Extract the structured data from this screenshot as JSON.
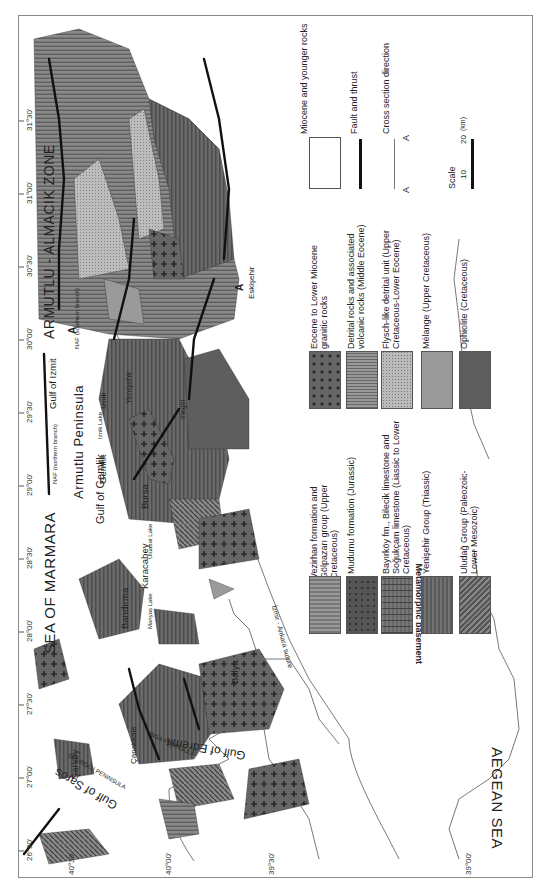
{
  "map": {
    "orientation": "rotated -90 degrees (north at left)",
    "longitude_ticks": [
      "26°30'",
      "27°00'",
      "27°30'",
      "28°00'",
      "28°30'",
      "29°00'",
      "29°30'",
      "30°00'",
      "30°30'",
      "31°00'",
      "31°30'"
    ],
    "latitude_ticks": [
      "40°30'",
      "40°00'",
      "39°30'",
      "39°00'"
    ],
    "seas": {
      "marmara": "SEA OF MARMARA",
      "aegean": "AEGEAN SEA"
    },
    "zones": {
      "armutlu_almacik": "ARMUTLU - ALMACIK ZONE",
      "armutlu_peninsula": "Armutlu Peninsula"
    },
    "gulfs": {
      "saros": "Gulf of Saros",
      "edremit": "Gulf of Edremit",
      "gemlik": "Gulf of Gemlik",
      "izmit": "Gulf of Izmit"
    },
    "peninsulas": {
      "gelibolu": "GELIBOLU PENINSULA",
      "biga": "BIGA PENINSULA"
    },
    "towns": {
      "sarkoy": "Şarköy",
      "canakkale": "Çanakkale",
      "balya": "Balya",
      "bandirma": "Bandırma",
      "karacabey": "Karacabey",
      "bursa": "Bursa",
      "gemlik": "Gemlik",
      "iznik": "Iznik",
      "yenisehir": "Yenişehir",
      "inegol": "Inegöl",
      "eskisehir": "Eskişehir"
    },
    "lakes": {
      "iznik_lake": "Iznik Lake",
      "manyas_lake": "Manyas Lake",
      "uluabat_lake": "Uluabat Lake"
    },
    "faults": {
      "naf_northern": "NAF (northern branch)",
      "naf_southern": "NAF (southern branch)",
      "suture": "İzmir - Ankara suture"
    },
    "section_marker": "A"
  },
  "legend": {
    "metamorphic_group_label": "Metamorphic basement",
    "left_column": [
      {
        "id": "veziran",
        "label": "Vezirhan formation and Gölpazarı group (Upper Cretaceous)"
      },
      {
        "id": "mudurnu",
        "label": "Mudurnu formation (Jurassic)"
      },
      {
        "id": "bayirkoy",
        "label": "Bayırköy fm., Bilecik limestone and Soğukçam limestone (Liassic to Lower Cretaceous)"
      },
      {
        "id": "yenisehir",
        "label": "Yenişehir Group (Triassic)"
      },
      {
        "id": "uludag",
        "label": "Uludağ Group (Paleozoic-Lower Mesozoic)"
      }
    ],
    "right_column": [
      {
        "id": "eocene",
        "label": "Eocene to Lower Miocene granitic rocks"
      },
      {
        "id": "detrital",
        "label": "Detrital rocks and associated volcanic rocks (Middle Eocene)"
      },
      {
        "id": "flysch",
        "label": "Flysch-like detrital unit (Upper Cretaceous-Lower Eocene)"
      },
      {
        "id": "melange",
        "label": "Mélange (Upper Cretaceous)"
      },
      {
        "id": "ophiolite",
        "label": "Ophiolite (Cretaceous)"
      }
    ],
    "extra": {
      "miocene": "Miocene and younger rocks",
      "fault": "Fault and thrust",
      "cross_section": "Cross section direction",
      "cross_section_end": "A",
      "scale_title": "Scale",
      "scale_10": "10",
      "scale_20": "20",
      "scale_unit": "(km)"
    }
  }
}
